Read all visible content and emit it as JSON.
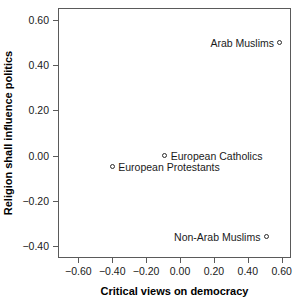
{
  "chart_data": {
    "type": "scatter",
    "title": "",
    "xlabel": "Critical views on democracy",
    "ylabel": "Religion shall influence politics",
    "xlim": [
      -0.72,
      0.655
    ],
    "ylim": [
      -0.455,
      0.655
    ],
    "xticks": [
      -0.6,
      -0.4,
      -0.2,
      0.0,
      0.2,
      0.4,
      0.6
    ],
    "xticklabels": [
      "-0.60",
      "-0.40",
      "-0.20",
      "0.00",
      "0.20",
      "0.40",
      "0.60"
    ],
    "yticks": [
      0.6,
      0.4,
      0.2,
      0.0,
      -0.2,
      -0.4
    ],
    "yticklabels": [
      "0.60",
      "0.40",
      "0.20",
      "0.00",
      "-0.20",
      "-0.40"
    ],
    "grid": false,
    "legend": "none",
    "marker": "open-circle",
    "marker_color": "#2b2b2b",
    "points": [
      {
        "label": "Arab Muslims",
        "x": 0.59,
        "y": 0.5,
        "label_side": "left"
      },
      {
        "label": "European Catholics",
        "x": -0.09,
        "y": 0.0,
        "label_side": "right"
      },
      {
        "label": "European Protestants",
        "x": -0.4,
        "y": -0.05,
        "label_side": "right"
      },
      {
        "label": "Non-Arab Muslims",
        "x": 0.51,
        "y": -0.36,
        "label_side": "left"
      }
    ]
  }
}
